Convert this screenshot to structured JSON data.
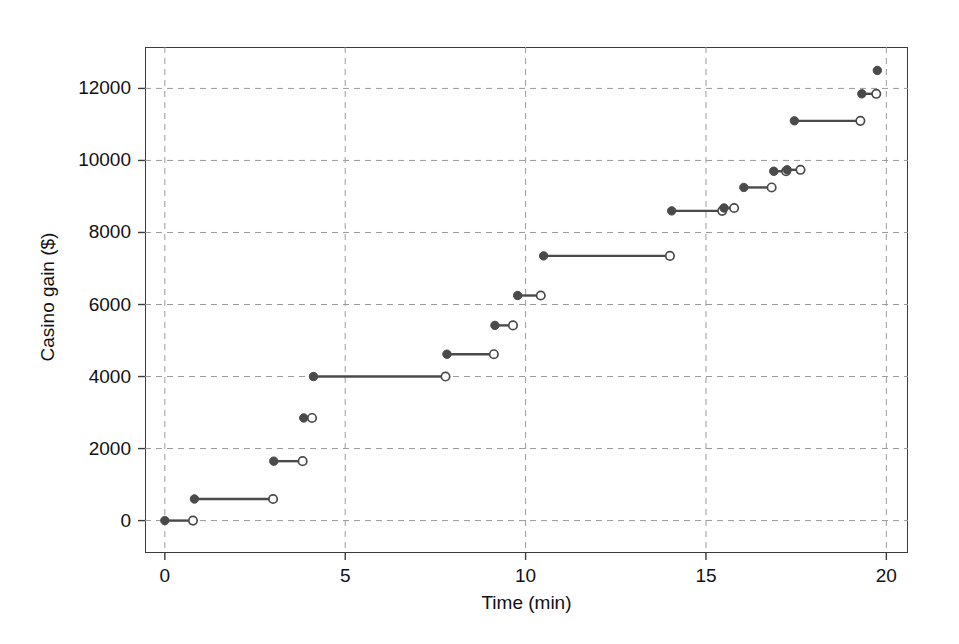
{
  "chart_data": {
    "type": "line",
    "subtype": "step-function-segments",
    "title": "",
    "xlabel": "Time (min)",
    "ylabel": "Casino gain ($)",
    "xlim": [
      -0.55,
      20.6
    ],
    "ylim": [
      -900,
      13150
    ],
    "xticks": [
      0,
      5,
      10,
      15,
      20
    ],
    "xtick_labels": [
      "0",
      "5",
      "10",
      "15",
      "20"
    ],
    "yticks": [
      0,
      2000,
      4000,
      6000,
      8000,
      10000,
      12000
    ],
    "ytick_labels": [
      "0",
      "2000",
      "4000",
      "6000",
      "8000",
      "10000",
      "12000"
    ],
    "grid": true,
    "grid_style": "dashed",
    "grid_color": "#9a9a9a",
    "legend": "none",
    "marker_color": "#4a4a4a",
    "line_color": "#4a4a4a",
    "frame_color": "#3c3c3c",
    "background": "#ffffff",
    "start_marker": "filled-circle",
    "end_marker": "open-circle",
    "series": [
      {
        "name": "Casino gain",
        "segments": [
          {
            "x_start": 0.0,
            "x_end": 0.78,
            "y": 0
          },
          {
            "x_start": 0.82,
            "x_end": 3.0,
            "y": 600
          },
          {
            "x_start": 3.02,
            "x_end": 3.82,
            "y": 1650
          },
          {
            "x_start": 3.85,
            "x_end": 4.08,
            "y": 2850
          },
          {
            "x_start": 4.12,
            "x_end": 7.78,
            "y": 4000
          },
          {
            "x_start": 7.82,
            "x_end": 9.12,
            "y": 4620
          },
          {
            "x_start": 9.15,
            "x_end": 9.65,
            "y": 5420
          },
          {
            "x_start": 9.78,
            "x_end": 10.42,
            "y": 6250
          },
          {
            "x_start": 10.5,
            "x_end": 14.0,
            "y": 7350
          },
          {
            "x_start": 14.05,
            "x_end": 15.45,
            "y": 8600
          },
          {
            "x_start": 15.5,
            "x_end": 15.78,
            "y": 8680
          },
          {
            "x_start": 16.05,
            "x_end": 16.82,
            "y": 9250
          },
          {
            "x_start": 16.88,
            "x_end": 17.22,
            "y": 9700
          },
          {
            "x_start": 17.25,
            "x_end": 17.62,
            "y": 9740
          },
          {
            "x_start": 17.45,
            "x_end": 19.28,
            "y": 11100
          },
          {
            "x_start": 19.32,
            "x_end": 19.72,
            "y": 11850
          }
        ],
        "points": [
          {
            "x": 19.75,
            "y": 12500,
            "marker": "filled-circle"
          }
        ]
      }
    ]
  }
}
